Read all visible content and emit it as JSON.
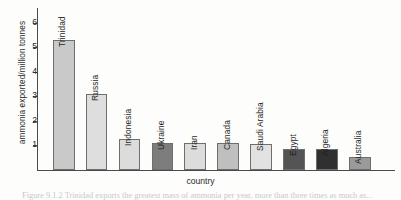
{
  "chart_data": {
    "type": "bar",
    "title": "",
    "xlabel": "country",
    "ylabel": "ammonia exported/million tonnes",
    "ylim": [
      0,
      6.6
    ],
    "ytick_values": [
      1,
      2,
      3,
      4,
      5,
      6
    ],
    "ytick_labels": [
      "1",
      "2",
      "3",
      "4",
      "5",
      "6"
    ],
    "grid": false,
    "legend": "none",
    "categories": [
      "Trinidad",
      "Russia",
      "Indonesia",
      "Ukraine",
      "Iran",
      "Canada",
      "Saudi Arabia",
      "Egypt",
      "Algeria",
      "Australia"
    ],
    "values": [
      5.3,
      3.1,
      1.25,
      1.1,
      1.1,
      1.1,
      1.05,
      0.85,
      0.85,
      0.55
    ],
    "bar_colors": [
      "#c9c9c9",
      "#dedede",
      "#dcdcdc",
      "#7d7d7d",
      "#dcdcdc",
      "#bfbfbf",
      "#e2e2e2",
      "#545454",
      "#303030",
      "#9a9a9a"
    ],
    "bar_edge_color": "#6e6e6e"
  },
  "caption": {
    "text": "Figure 9.1.2  Trinidad exports the greatest mass of ammonia per year, more than three times as much as...",
    "cropped": true
  },
  "colors": {
    "axis": "#4a4a4a",
    "background": "#fdfdfb",
    "text": "#1f1f1f"
  }
}
